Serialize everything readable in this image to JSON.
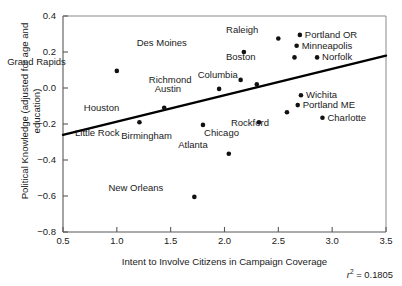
{
  "chart_data": {
    "type": "scatter",
    "title": "",
    "xlabel": "Intent to Involve Citizens in Campaign Coverage",
    "ylabel": "Political Knowledge (adjusted for age and education)",
    "xlim": [
      0.5,
      3.5
    ],
    "ylim": [
      -0.8,
      0.4
    ],
    "xticks": [
      "0.5",
      "1.0",
      "1.5",
      "2.0",
      "2.5",
      "3.0",
      "3.5"
    ],
    "xtick_values": [
      0.5,
      1.0,
      1.5,
      2.0,
      2.5,
      3.0,
      3.5
    ],
    "yticks": [
      "0.4",
      "0.2",
      "0.0",
      "-0.2",
      "-0.4",
      "-0.6",
      "-0.8"
    ],
    "ytick_values": [
      0.4,
      0.2,
      0.0,
      -0.2,
      -0.4,
      -0.6,
      -0.8
    ],
    "grid": false,
    "legend": false,
    "annotation": "r2 = 0.1805",
    "r_squared": 0.1805,
    "r_squared_text": "= 0.1805",
    "r_symbol": "r",
    "r_exponent": "2",
    "trendline": {
      "x_start": 0.5,
      "y_start": -0.26,
      "x_end": 3.5,
      "y_end": 0.18
    },
    "points": [
      {
        "label": "Grand Rapids",
        "x": 1.0,
        "y": 0.095,
        "label_dx": -51,
        "label_dy": -6
      },
      {
        "label": "Houston",
        "x": 1.44,
        "y": -0.11,
        "label_dx": -45,
        "label_dy": 3
      },
      {
        "label": "Little Rock",
        "x": 1.21,
        "y": -0.19,
        "label_dx": -20,
        "label_dy": 14
      },
      {
        "label": "Birmingham",
        "x": 1.8,
        "y": -0.205,
        "label_dx": -31,
        "label_dy": 14
      },
      {
        "label": "Austin",
        "x": 1.95,
        "y": -0.005,
        "label_dx": -38,
        "label_dy": 3
      },
      {
        "label": "Atlanta",
        "x": 2.04,
        "y": -0.365,
        "label_dx": -21,
        "label_dy": -6
      },
      {
        "label": "New Orleans",
        "x": 1.72,
        "y": -0.605,
        "label_dx": -31,
        "label_dy": -6
      },
      {
        "label": "Des Moines",
        "x": 2.18,
        "y": 0.2,
        "label_dx": -57,
        "label_dy": -6
      },
      {
        "label": "Richmond",
        "x": 2.15,
        "y": 0.045,
        "label_dx": -49,
        "label_dy": 3
      },
      {
        "label": "Columbia",
        "x": 2.3,
        "y": 0.02,
        "label_dx": -19,
        "label_dy": -6
      },
      {
        "label": "Chicago",
        "x": 2.32,
        "y": -0.19,
        "label_dx": -20,
        "label_dy": 14
      },
      {
        "label": "Raleigh",
        "x": 2.5,
        "y": 0.275,
        "label_dx": -20,
        "label_dy": -6
      },
      {
        "label": "Boston",
        "x": 2.65,
        "y": 0.17,
        "label_dx": -39,
        "label_dy": 3
      },
      {
        "label": "Minneapolis",
        "x": 2.67,
        "y": 0.235,
        "label_dx": 5,
        "label_dy": 3
      },
      {
        "label": "Portland OR",
        "x": 2.7,
        "y": 0.295,
        "label_dx": 5,
        "label_dy": 3
      },
      {
        "label": "Wichita",
        "x": 2.71,
        "y": -0.04,
        "label_dx": 5,
        "label_dy": 3
      },
      {
        "label": "Portland ME",
        "x": 2.68,
        "y": -0.095,
        "label_dx": 5,
        "label_dy": 3
      },
      {
        "label": "Rockford",
        "x": 2.58,
        "y": -0.135,
        "label_dx": -18,
        "label_dy": 14
      },
      {
        "label": "Norfolk",
        "x": 2.86,
        "y": 0.17,
        "label_dx": 5,
        "label_dy": 3
      },
      {
        "label": "Charlotte",
        "x": 2.91,
        "y": -0.165,
        "label_dx": 5,
        "label_dy": 3
      }
    ]
  }
}
